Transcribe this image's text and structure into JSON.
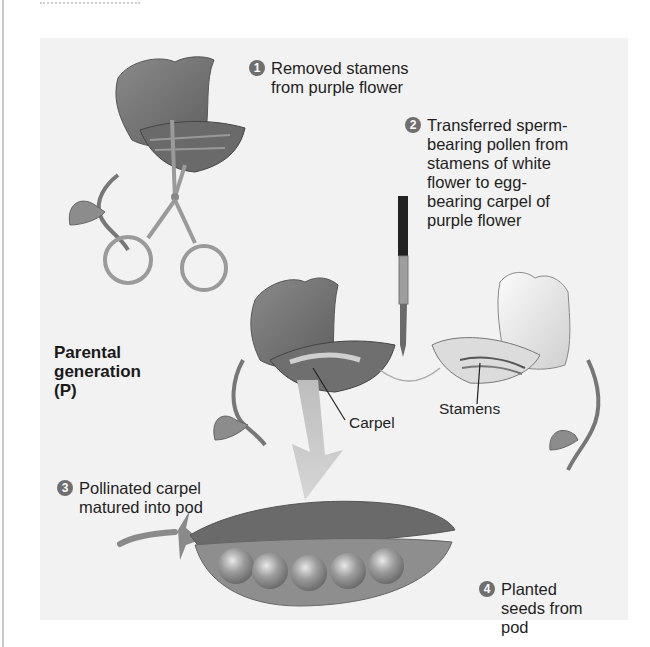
{
  "figure": {
    "title_cut": "",
    "steps": [
      {
        "num": "1",
        "text": "Removed stamens\nfrom purple flower"
      },
      {
        "num": "2",
        "text": "Transferred sperm-\nbearing pollen from\nstamens of white\nflower to egg-\nbearing carpel of\npurple flower"
      },
      {
        "num": "3",
        "text": "Pollinated carpel\nmatured into pod"
      },
      {
        "num": "4",
        "text": "Planted\nseeds from\npod"
      }
    ],
    "generation_label": "Parental\ngeneration\n(P)",
    "callouts": {
      "carpel": "Carpel",
      "stamens": "Stamens"
    },
    "colors": {
      "panel": "#f2f2f2",
      "purple_flower": "#7a7a7a",
      "white_flower": "#e6e6e6",
      "step_badge": "#6f6f6f",
      "arrow": "#c9c9c9"
    },
    "illustrations": [
      "purple-flower-with-scissors",
      "paintbrush",
      "purple-flower",
      "white-flower",
      "pea-pod-with-5-seeds"
    ]
  }
}
